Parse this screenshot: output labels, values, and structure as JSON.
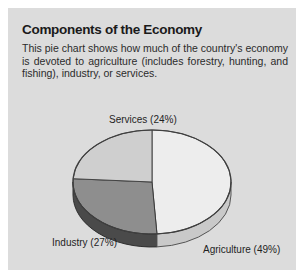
{
  "panel": {
    "title": "Components of the Economy",
    "description": "This pie chart shows how much of the country's economy is devoted to agriculture (includes forestry, hunting, and fishing), industry, or services.",
    "background_color": "#dcdcdc",
    "page_background_color": "#ffffff"
  },
  "chart_data": {
    "type": "pie",
    "title": "Components of the Economy",
    "subtitle": "This pie chart shows how much of the country's economy is devoted to agriculture (includes forestry, hunting, and fishing), industry, or services.",
    "style": "3d-pie",
    "start_angle_deg": 0,
    "direction": "clockwise",
    "legend": "none",
    "labels_position": "outside",
    "categories": [
      "Agriculture",
      "Industry",
      "Services"
    ],
    "values": [
      49,
      27,
      24
    ],
    "unit": "%",
    "slices": [
      {
        "name": "Agriculture",
        "value": 49,
        "label": "Agriculture (49%)",
        "color": "#ededed",
        "side_color": "#c9c9c9",
        "start_deg": 0,
        "end_deg": 176.4
      },
      {
        "name": "Industry",
        "value": 27,
        "label": "Industry (27%)",
        "color": "#8e8e8e",
        "side_color": "#4a4a4a",
        "start_deg": 176.4,
        "end_deg": 273.6
      },
      {
        "name": "Services",
        "value": 24,
        "label": "Services (24%)",
        "color": "#cfcfcf",
        "side_color": "#9a9a9a",
        "start_deg": 273.6,
        "end_deg": 360
      }
    ],
    "outline_color": "#3a3a3a",
    "xlabel": "",
    "ylabel": ""
  }
}
